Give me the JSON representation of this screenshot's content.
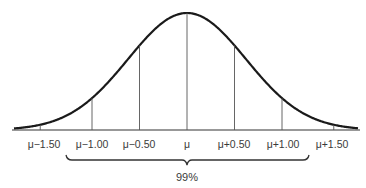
{
  "chart_data": {
    "type": "line",
    "title": "",
    "xlabel": "",
    "ylabel": "",
    "x_ticks": [
      "μ−1.50",
      "μ−1.00",
      "μ−0.50",
      "μ",
      "μ+0.50",
      "μ+1.00",
      "μ+1.50"
    ],
    "x_tick_values": [
      -1.5,
      -1.0,
      -0.5,
      0,
      0.5,
      1.0,
      1.5
    ],
    "vertical_markers_at": [
      -1.0,
      -0.5,
      0,
      0.5,
      1.0
    ],
    "annotation": {
      "text": "99%",
      "type": "brace",
      "spans_from_label_index": 1,
      "spans_to_label_index": 6
    },
    "grid": false,
    "legend": null
  },
  "labels": {
    "ticks": [
      "μ−1.50",
      "μ−1.00",
      "μ−0.50",
      "μ",
      "μ+0.50",
      "μ+1.00",
      "μ+1.50"
    ],
    "percent": "99%"
  },
  "colors": {
    "curve": "#1a1a1a",
    "lines": "#555555",
    "text": "#3a3a3a",
    "background": "#ffffff"
  }
}
